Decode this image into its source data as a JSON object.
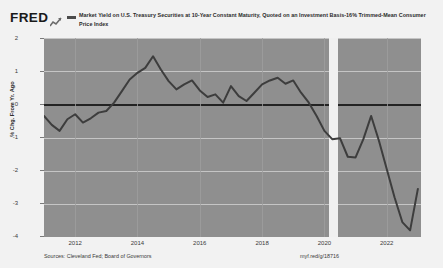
{
  "brand": {
    "logo_text": "FRED",
    "logo_glyph_icon": "line-chart-icon"
  },
  "legend": {
    "swatch_color": "#4b4b4b",
    "label": "Market Yield on U.S. Treasury Securities at 10-Year Constant Maturity, Quoted on an Investment Basis-16% Trimmed-Mean Consumer Price Index"
  },
  "footer": {
    "sources": "Sources: Cleveland Fed; Board of Governors",
    "url": "myf.red/g/18716"
  },
  "axis": {
    "y_label": "% Chg. From Yr. Ago",
    "y_ticks": [
      "2",
      "1",
      "0",
      "-1",
      "-2",
      "-3",
      "-4"
    ],
    "x_ticks": [
      "2012",
      "2014",
      "2016",
      "2018",
      "2020",
      "2022"
    ]
  },
  "style": {
    "plot_background": "#8f8f8f",
    "gridline_color": "#cfcfcf",
    "zero_line_color": "#232323",
    "series_color": "#3d3d3d",
    "recession_band_color": "#f0f0f0",
    "page_background": "#f2f2f2"
  },
  "chart_data": {
    "type": "line",
    "title": "Market Yield on U.S. Treasury Securities at 10-Year Constant Maturity, Quoted on an Investment Basis-16% Trimmed-Mean Consumer Price Index",
    "xlabel": "",
    "ylabel": "% Chg. From Yr. Ago",
    "xlim": [
      2011.0,
      2023.1
    ],
    "ylim": [
      -4,
      2
    ],
    "grid": true,
    "legend_position": "top",
    "zero_line": 0,
    "recession_bands": [
      [
        2020.15,
        2020.45
      ]
    ],
    "series": [
      {
        "name": "Market Yield on U.S. Treasury Securities at 10-Year Constant Maturity, Quoted on an Investment Basis-16% Trimmed-Mean Consumer Price Index",
        "color": "#3d3d3d",
        "x": [
          2011.0,
          2011.25,
          2011.5,
          2011.75,
          2012.0,
          2012.25,
          2012.5,
          2012.75,
          2013.0,
          2013.25,
          2013.5,
          2013.75,
          2014.0,
          2014.25,
          2014.5,
          2014.75,
          2015.0,
          2015.25,
          2015.5,
          2015.75,
          2016.0,
          2016.25,
          2016.5,
          2016.75,
          2017.0,
          2017.25,
          2017.5,
          2017.75,
          2018.0,
          2018.25,
          2018.5,
          2018.75,
          2019.0,
          2019.25,
          2019.5,
          2019.75,
          2020.0,
          2020.25,
          2020.5,
          2020.75,
          2021.0,
          2021.25,
          2021.5,
          2021.75,
          2022.0,
          2022.25,
          2022.5,
          2022.75,
          2023.0
        ],
        "y": [
          -0.35,
          -0.62,
          -0.8,
          -0.45,
          -0.3,
          -0.55,
          -0.42,
          -0.25,
          -0.2,
          0.05,
          0.4,
          0.75,
          0.95,
          1.1,
          1.45,
          1.05,
          0.7,
          0.45,
          0.6,
          0.72,
          0.42,
          0.22,
          0.3,
          0.05,
          0.55,
          0.25,
          0.1,
          0.35,
          0.6,
          0.72,
          0.8,
          0.62,
          0.72,
          0.35,
          0.05,
          -0.35,
          -0.8,
          -1.05,
          -1.02,
          -1.58,
          -1.6,
          -1.05,
          -0.35,
          -1.1,
          -1.95,
          -2.8,
          -3.55,
          -3.8,
          -2.55
        ]
      }
    ]
  }
}
